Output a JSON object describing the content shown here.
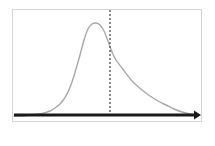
{
  "figure": {
    "background_color": "#ffffff",
    "frame": {
      "border_color": "#d6d6d6",
      "x": 12,
      "y": 9,
      "width": 190,
      "height": 113
    }
  },
  "chart_data": {
    "type": "line",
    "title": "",
    "subtitle": "",
    "xlabel": "",
    "ylabel": "",
    "grid": false,
    "legend": null,
    "axis_style": "single horizontal arrow axis pointing right, no tick labels",
    "xlim": [
      0,
      190
    ],
    "ylim": [
      0,
      113
    ],
    "series": [
      {
        "name": "right-skewed density curve",
        "color": "#a8a8a8",
        "line_width": 1.4,
        "style": "solid",
        "description": "Unimodal positively-skewed (right-skewed) probability density curve; steep rise on the left, rounded peak, long gradual tail to the right",
        "x": [
          14,
          22,
          30,
          38,
          44,
          50,
          55,
          60,
          64,
          68,
          72,
          76,
          80,
          84,
          88,
          92,
          96,
          100,
          104,
          108,
          112,
          116,
          122,
          128,
          134,
          142,
          150,
          158,
          166,
          174,
          182,
          190,
          198
        ],
        "y": [
          116,
          116,
          115,
          114,
          113,
          111,
          108,
          104,
          99,
          92,
          82,
          69,
          55,
          40,
          29,
          24,
          23,
          25,
          31,
          41,
          52,
          60,
          68,
          76,
          83,
          90,
          96,
          101,
          105,
          109,
          112,
          114,
          115
        ]
      }
    ],
    "annotations": [
      {
        "name": "threshold-line",
        "type": "vertical-dashed-line",
        "x": 110,
        "y_top": 10,
        "y_bottom": 117,
        "color": "#666666",
        "line_width": 1.5,
        "dash": "2,2",
        "label": ""
      },
      {
        "name": "x-axis-arrow",
        "type": "horizontal-arrow",
        "x_start": 14,
        "x_end": 201,
        "y": 115,
        "color": "#1a1a1a",
        "line_width": 3,
        "arrowhead": "right",
        "label": ""
      }
    ]
  }
}
